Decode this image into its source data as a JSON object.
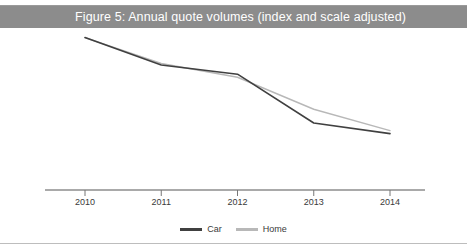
{
  "figure": {
    "title": "Figure 5: Annual quote volumes (index and scale adjusted)",
    "title_band_color": "#8c8c8c",
    "title_text_color": "#ffffff",
    "background_color": "#ffffff",
    "bottom_rule_color": "#bdbdbd"
  },
  "legend": {
    "position": "bottom-center",
    "entries": [
      {
        "label": "Car",
        "color": "#404040"
      },
      {
        "label": "Home",
        "color": "#b8b8b8"
      }
    ]
  },
  "axis": {
    "line_color": "#555555",
    "tick_color": "#777777",
    "tick_labels": [
      "2010",
      "2011",
      "2012",
      "2013",
      "2014"
    ]
  },
  "chart_data": {
    "type": "line",
    "title": "Figure 5: Annual quote volumes (index and scale adjusted)",
    "subtitle": "",
    "xlabel": "",
    "ylabel": "",
    "x": [
      "2010",
      "2011",
      "2012",
      "2013",
      "2014"
    ],
    "categories": [
      "2010",
      "2011",
      "2012",
      "2013",
      "2014"
    ],
    "series": [
      {
        "name": "Car",
        "color": "#404040",
        "values": [
          100,
          82,
          76,
          44,
          37
        ]
      },
      {
        "name": "Home",
        "color": "#b8b8b8",
        "values": [
          100,
          83,
          74,
          53,
          39
        ]
      }
    ],
    "ylim": [
      0,
      105
    ],
    "xlim": [
      0,
      4
    ],
    "grid": false,
    "y_axis_visible": false,
    "x_axis_visible": true,
    "legend_position": "bottom-center",
    "annotations": []
  }
}
